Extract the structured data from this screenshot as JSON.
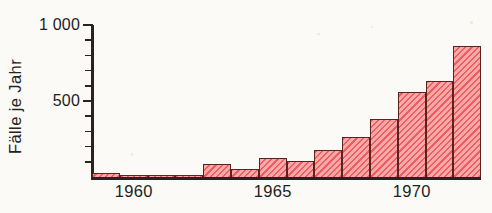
{
  "chart_data": {
    "type": "bar",
    "title": "",
    "xlabel": "",
    "ylabel": "Fälle je Jahr",
    "ylim": [
      0,
      1000
    ],
    "xlim": [
      1959,
      1973
    ],
    "grid": false,
    "legend": null,
    "y_ticks_major": [
      {
        "value": 500,
        "label": "500"
      },
      {
        "value": 1000,
        "label": "1 000"
      }
    ],
    "y_ticks_minor": [
      100,
      200,
      300,
      400,
      600,
      700,
      800,
      900
    ],
    "x_tick_labels": [
      {
        "value": 1960,
        "label": "1960"
      },
      {
        "value": 1965,
        "label": "1965"
      },
      {
        "value": 1970,
        "label": "1970"
      }
    ],
    "categories": [
      "1959",
      "1960",
      "1961",
      "1962",
      "1963",
      "1964",
      "1965",
      "1966",
      "1967",
      "1968",
      "1969",
      "1970",
      "1971",
      "1972"
    ],
    "values": [
      30,
      8,
      8,
      8,
      95,
      60,
      130,
      110,
      185,
      270,
      390,
      565,
      640,
      870
    ],
    "bar_fill_color": "#ef5c62",
    "bar_edge_color": "#5b2320",
    "background_color": "#fbfaf6",
    "axis_color": "#2a2220",
    "text_color": "#221e1d"
  }
}
